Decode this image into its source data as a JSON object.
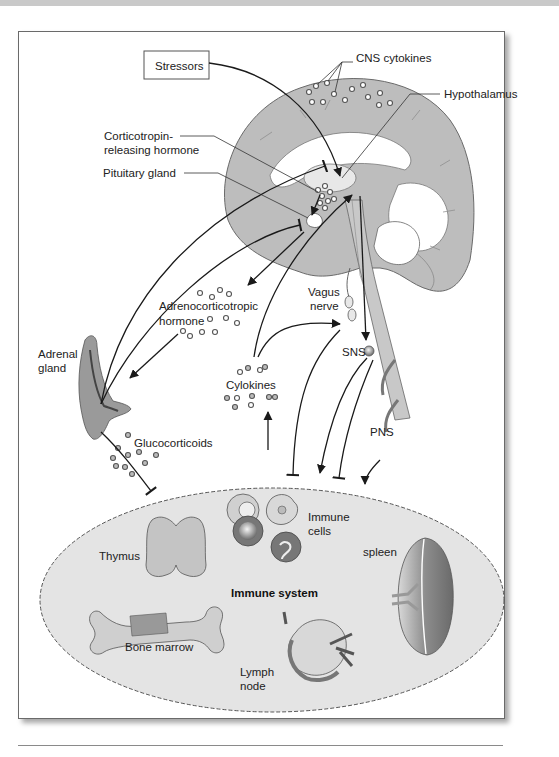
{
  "figure": {
    "labels": {
      "stressors": "Stressors",
      "cns_cytokines": "CNS cytokines",
      "hypothalamus": "Hypothalamus",
      "crh_line1": "Corticotropin-",
      "crh_line2": "releasing hormone",
      "pituitary": "Pituitary gland",
      "acth_line1": "Adrenocorticotropic",
      "acth_line2": "hormone",
      "vagus_line1": "Vagus",
      "vagus_line2": "nerve",
      "adrenal_line1": "Adrenal",
      "adrenal_line2": "gland",
      "cytokines": "Cylokines",
      "sns": "SNS",
      "pns": "PNS",
      "glucocorticoids": "Glucocorticoids",
      "immune_cells_line1": "Immune",
      "immune_cells_line2": "cells",
      "thymus": "Thymus",
      "spleen": "spleen",
      "immune_system": "Immune system",
      "bone_marrow": "Bone marrow",
      "lymph_line1": "Lymph",
      "lymph_line2": "node"
    },
    "colors": {
      "brain_fill": "#bdbdbd",
      "immune_fill": "#e4e4e4",
      "border": "#6a6a6a"
    }
  }
}
